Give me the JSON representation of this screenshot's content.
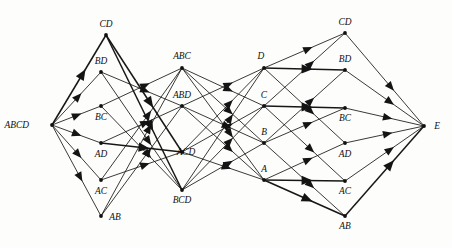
{
  "diagram": {
    "kind": "directed-graph",
    "background_color": "#fdfdfb",
    "edge_color": "#171717",
    "node_color": "#111111",
    "label_color": "#101010",
    "width": 452,
    "height": 248,
    "columns": [
      {
        "id": "col-source",
        "role": "source",
        "nodes": [
          "ABCD"
        ]
      },
      {
        "id": "col-left-pairs",
        "role": "left-pairs",
        "nodes": [
          "CD",
          "BD",
          "BC",
          "AD",
          "AC",
          "AB"
        ]
      },
      {
        "id": "col-triples",
        "role": "triples",
        "nodes": [
          "ABC",
          "ABD",
          "ACD",
          "BCD"
        ]
      },
      {
        "id": "col-singletons",
        "role": "singletons",
        "nodes": [
          "D",
          "C",
          "B",
          "A"
        ]
      },
      {
        "id": "col-right-pairs",
        "role": "right-pairs",
        "nodes": [
          "CD",
          "BD",
          "BC",
          "AD",
          "AC",
          "AB"
        ]
      },
      {
        "id": "col-sink",
        "role": "sink",
        "nodes": [
          "E"
        ]
      }
    ],
    "nodes": [
      {
        "id": "n_ABCD",
        "label": "ABCD",
        "x": 52,
        "y": 125,
        "label_x": 29,
        "label_y": 128,
        "anchor": "end",
        "column": "col-source"
      },
      {
        "id": "n_L_CD",
        "label": "CD",
        "x": 106,
        "y": 35,
        "label_x": 106,
        "label_y": 27,
        "anchor": "middle",
        "column": "col-left-pairs"
      },
      {
        "id": "n_L_BD",
        "label": "BD",
        "x": 101,
        "y": 72,
        "label_x": 101,
        "label_y": 64,
        "anchor": "middle",
        "column": "col-left-pairs"
      },
      {
        "id": "n_L_BC",
        "label": "BC",
        "x": 101,
        "y": 106,
        "label_x": 101,
        "label_y": 120,
        "anchor": "middle",
        "column": "col-left-pairs"
      },
      {
        "id": "n_L_AD",
        "label": "AD",
        "x": 101,
        "y": 143,
        "label_x": 101,
        "label_y": 157,
        "anchor": "middle",
        "column": "col-left-pairs"
      },
      {
        "id": "n_L_AC",
        "label": "AC",
        "x": 101,
        "y": 180,
        "label_x": 101,
        "label_y": 194,
        "anchor": "middle",
        "column": "col-left-pairs"
      },
      {
        "id": "n_L_AB",
        "label": "AB",
        "x": 101,
        "y": 216,
        "label_x": 115,
        "label_y": 220,
        "anchor": "middle",
        "column": "col-left-pairs"
      },
      {
        "id": "n_ABC",
        "label": "ABC",
        "x": 182,
        "y": 68,
        "label_x": 182,
        "label_y": 59,
        "anchor": "middle",
        "column": "col-triples"
      },
      {
        "id": "n_ABD",
        "label": "ABD",
        "x": 182,
        "y": 106,
        "label_x": 182,
        "label_y": 98,
        "anchor": "middle",
        "column": "col-triples"
      },
      {
        "id": "n_ACD",
        "label": "ACD",
        "x": 182,
        "y": 152,
        "label_x": 186,
        "label_y": 155,
        "anchor": "middle",
        "column": "col-triples"
      },
      {
        "id": "n_BCD",
        "label": "BCD",
        "x": 182,
        "y": 190,
        "label_x": 182,
        "label_y": 203,
        "anchor": "middle",
        "column": "col-triples"
      },
      {
        "id": "n_D",
        "label": "D",
        "x": 264,
        "y": 68,
        "label_x": 261,
        "label_y": 59,
        "anchor": "middle",
        "column": "col-singletons"
      },
      {
        "id": "n_C",
        "label": "C",
        "x": 264,
        "y": 106,
        "label_x": 264,
        "label_y": 98,
        "anchor": "middle",
        "column": "col-singletons"
      },
      {
        "id": "n_B",
        "label": "B",
        "x": 264,
        "y": 143,
        "label_x": 264,
        "label_y": 135,
        "anchor": "middle",
        "column": "col-singletons"
      },
      {
        "id": "n_A",
        "label": "A",
        "x": 264,
        "y": 180,
        "label_x": 264,
        "label_y": 172,
        "anchor": "middle",
        "column": "col-singletons"
      },
      {
        "id": "n_R_CD",
        "label": "CD",
        "x": 345,
        "y": 33,
        "label_x": 345,
        "label_y": 25,
        "anchor": "middle",
        "column": "col-right-pairs"
      },
      {
        "id": "n_R_BD",
        "label": "BD",
        "x": 345,
        "y": 70,
        "label_x": 345,
        "label_y": 62,
        "anchor": "middle",
        "column": "col-right-pairs"
      },
      {
        "id": "n_R_BC",
        "label": "BC",
        "x": 345,
        "y": 108,
        "label_x": 345,
        "label_y": 121,
        "anchor": "middle",
        "column": "col-right-pairs"
      },
      {
        "id": "n_R_AD",
        "label": "AD",
        "x": 345,
        "y": 143,
        "label_x": 345,
        "label_y": 157,
        "anchor": "middle",
        "column": "col-right-pairs"
      },
      {
        "id": "n_R_AC",
        "label": "AC",
        "x": 345,
        "y": 181,
        "label_x": 345,
        "label_y": 194,
        "anchor": "middle",
        "column": "col-right-pairs"
      },
      {
        "id": "n_R_AB",
        "label": "AB",
        "x": 345,
        "y": 216,
        "label_x": 345,
        "label_y": 229,
        "anchor": "middle",
        "column": "col-right-pairs"
      },
      {
        "id": "n_E",
        "label": "E",
        "x": 424,
        "y": 126,
        "label_x": 437,
        "label_y": 129,
        "anchor": "middle",
        "column": "col-sink"
      }
    ],
    "edges": [
      {
        "from": "n_ABCD",
        "to": "n_L_CD",
        "weight": "bold"
      },
      {
        "from": "n_ABCD",
        "to": "n_L_BD",
        "weight": "normal"
      },
      {
        "from": "n_ABCD",
        "to": "n_L_BC",
        "weight": "normal"
      },
      {
        "from": "n_ABCD",
        "to": "n_L_AD",
        "weight": "normal"
      },
      {
        "from": "n_ABCD",
        "to": "n_L_AC",
        "weight": "normal"
      },
      {
        "from": "n_ABCD",
        "to": "n_L_AB",
        "weight": "normal"
      },
      {
        "from": "n_L_CD",
        "to": "n_ACD",
        "weight": "bold"
      },
      {
        "from": "n_L_CD",
        "to": "n_BCD",
        "weight": "bold"
      },
      {
        "from": "n_L_BD",
        "to": "n_ABD",
        "weight": "normal"
      },
      {
        "from": "n_L_BD",
        "to": "n_BCD",
        "weight": "normal"
      },
      {
        "from": "n_L_BC",
        "to": "n_ABC",
        "weight": "normal"
      },
      {
        "from": "n_L_BC",
        "to": "n_BCD",
        "weight": "normal"
      },
      {
        "from": "n_L_AD",
        "to": "n_ABD",
        "weight": "normal"
      },
      {
        "from": "n_L_AD",
        "to": "n_ACD",
        "weight": "bold"
      },
      {
        "from": "n_L_AC",
        "to": "n_ABC",
        "weight": "normal"
      },
      {
        "from": "n_L_AC",
        "to": "n_ACD",
        "weight": "normal"
      },
      {
        "from": "n_L_AB",
        "to": "n_ABC",
        "weight": "normal"
      },
      {
        "from": "n_L_AB",
        "to": "n_ABD",
        "weight": "normal"
      },
      {
        "from": "n_ABC",
        "to": "n_A",
        "weight": "normal"
      },
      {
        "from": "n_ABC",
        "to": "n_B",
        "weight": "normal"
      },
      {
        "from": "n_ABC",
        "to": "n_C",
        "weight": "normal"
      },
      {
        "from": "n_ABD",
        "to": "n_A",
        "weight": "normal"
      },
      {
        "from": "n_ABD",
        "to": "n_B",
        "weight": "normal"
      },
      {
        "from": "n_ABD",
        "to": "n_D",
        "weight": "normal"
      },
      {
        "from": "n_ACD",
        "to": "n_A",
        "weight": "normal"
      },
      {
        "from": "n_ACD",
        "to": "n_C",
        "weight": "normal"
      },
      {
        "from": "n_ACD",
        "to": "n_D",
        "weight": "normal"
      },
      {
        "from": "n_BCD",
        "to": "n_B",
        "weight": "normal"
      },
      {
        "from": "n_BCD",
        "to": "n_C",
        "weight": "normal"
      },
      {
        "from": "n_BCD",
        "to": "n_D",
        "weight": "normal"
      },
      {
        "from": "n_D",
        "to": "n_R_CD",
        "weight": "normal"
      },
      {
        "from": "n_D",
        "to": "n_R_BD",
        "weight": "bold"
      },
      {
        "from": "n_D",
        "to": "n_R_AD",
        "weight": "normal"
      },
      {
        "from": "n_C",
        "to": "n_R_CD",
        "weight": "normal"
      },
      {
        "from": "n_C",
        "to": "n_R_BC",
        "weight": "bold"
      },
      {
        "from": "n_C",
        "to": "n_R_AC",
        "weight": "normal"
      },
      {
        "from": "n_B",
        "to": "n_R_BD",
        "weight": "normal"
      },
      {
        "from": "n_B",
        "to": "n_R_BC",
        "weight": "normal"
      },
      {
        "from": "n_B",
        "to": "n_R_AB",
        "weight": "normal"
      },
      {
        "from": "n_A",
        "to": "n_R_AD",
        "weight": "normal"
      },
      {
        "from": "n_A",
        "to": "n_R_AC",
        "weight": "bold"
      },
      {
        "from": "n_A",
        "to": "n_R_AB",
        "weight": "bold"
      },
      {
        "from": "n_R_CD",
        "to": "n_E",
        "weight": "normal"
      },
      {
        "from": "n_R_BD",
        "to": "n_E",
        "weight": "normal"
      },
      {
        "from": "n_R_BC",
        "to": "n_E",
        "weight": "normal"
      },
      {
        "from": "n_R_AD",
        "to": "n_E",
        "weight": "normal"
      },
      {
        "from": "n_R_AC",
        "to": "n_E",
        "weight": "normal"
      },
      {
        "from": "n_R_AB",
        "to": "n_E",
        "weight": "bold"
      }
    ]
  }
}
